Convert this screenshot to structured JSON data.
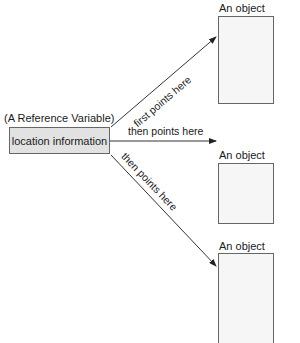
{
  "diagram": {
    "reference": {
      "caption": "(A Reference Variable)",
      "box_label": "location information",
      "fill_color": "#e2e2e2"
    },
    "objects": [
      {
        "label": "An object"
      },
      {
        "label": "An object"
      },
      {
        "label": "An object"
      }
    ],
    "arrows": [
      {
        "label": "first points here",
        "target": 0
      },
      {
        "label": "then points here",
        "target": 1
      },
      {
        "label": "then points here",
        "target": 2
      }
    ]
  }
}
